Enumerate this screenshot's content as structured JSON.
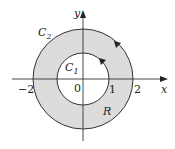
{
  "diagram": {
    "axes": {
      "x_label": "x",
      "y_label": "y"
    },
    "ticks": {
      "neg2": "−2",
      "zero": "0",
      "one": "1",
      "two": "2"
    },
    "curves": {
      "outer": {
        "name": "C",
        "sub": "2",
        "radius": 2,
        "orientation": "counterclockwise"
      },
      "inner": {
        "name": "C",
        "sub": "1",
        "radius": 1,
        "orientation": "counterclockwise"
      }
    },
    "region_label": "R",
    "colors": {
      "region_fill": "#dcdcdc",
      "stroke": "#333333",
      "background": "#ffffff"
    }
  }
}
